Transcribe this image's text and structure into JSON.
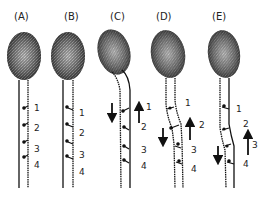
{
  "figure": {
    "panels": [
      {
        "id": "A",
        "label": "(A)",
        "numbers": [
          "1",
          "2",
          "3",
          "4"
        ],
        "arrows": []
      },
      {
        "id": "B",
        "label": "(B)",
        "numbers": [
          "1",
          "2",
          "3",
          "4"
        ],
        "arrows": []
      },
      {
        "id": "C",
        "label": "(C)",
        "numbers": [
          "1",
          "2",
          "3",
          "4"
        ],
        "arrows": [
          "down",
          "up"
        ]
      },
      {
        "id": "D",
        "label": "(D)",
        "numbers": [
          "1",
          "2",
          "3",
          "4"
        ],
        "arrows": [
          "down",
          "up"
        ]
      },
      {
        "id": "E",
        "label": "(E)",
        "numbers": [
          "1",
          "2",
          "3",
          "4"
        ],
        "arrows": [
          "down",
          "up"
        ]
      }
    ]
  }
}
